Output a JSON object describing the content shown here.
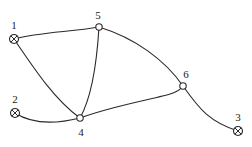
{
  "diagram": {
    "type": "network-graph",
    "nodes": [
      {
        "id": "1",
        "label": "1",
        "kind": "terminal",
        "x": 14,
        "y": 39,
        "lx": 14,
        "ly": 28
      },
      {
        "id": "2",
        "label": "2",
        "kind": "terminal",
        "x": 15,
        "y": 113,
        "lx": 15,
        "ly": 102
      },
      {
        "id": "3",
        "label": "3",
        "kind": "terminal",
        "x": 238,
        "y": 131,
        "lx": 238,
        "ly": 120
      },
      {
        "id": "4",
        "label": "4",
        "kind": "junction",
        "x": 80,
        "y": 118,
        "lx": 81,
        "ly": 135
      },
      {
        "id": "5",
        "label": "5",
        "kind": "junction",
        "x": 99,
        "y": 27,
        "lx": 98,
        "ly": 18
      },
      {
        "id": "6",
        "label": "6",
        "kind": "junction",
        "x": 183,
        "y": 86,
        "lx": 185,
        "ly": 77
      }
    ],
    "edges": [
      {
        "from": "1",
        "to": "5"
      },
      {
        "from": "1",
        "to": "4"
      },
      {
        "from": "5",
        "to": "4"
      },
      {
        "from": "5",
        "to": "6"
      },
      {
        "from": "2",
        "to": "4"
      },
      {
        "from": "4",
        "to": "6"
      },
      {
        "from": "6",
        "to": "3"
      }
    ],
    "colors": {
      "stroke": "#2a2a2a",
      "background": "#ffffff"
    }
  }
}
